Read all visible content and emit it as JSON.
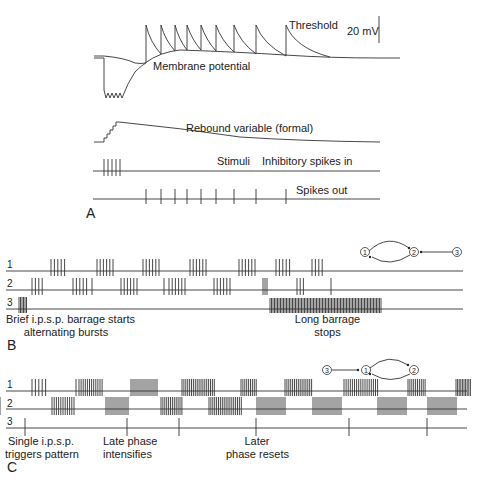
{
  "panel_a": {
    "letter": "A",
    "threshold_label": "Threshold",
    "scale_label": "20 mV",
    "membrane_label": "Membrane potential",
    "rebound_label": "Rebound variable (formal)",
    "stimuli_label": "Stimuli",
    "inhibitory_label": "Inhibitory spikes in",
    "spikes_out_label": "Spikes out",
    "stimuli_x": [
      107,
      111,
      115,
      119,
      123
    ],
    "spikes_out_x": [
      146,
      161,
      175,
      187,
      201,
      216,
      234,
      256,
      286
    ]
  },
  "panel_b": {
    "letter": "B",
    "trace_labels": [
      "1",
      "2",
      "3"
    ],
    "annotation_left_line1": "Brief i.p.s.p. barrage starts",
    "annotation_left_line2": "alternating bursts",
    "annotation_right_line1": "Long barrage",
    "annotation_right_line2": "stops",
    "network": {
      "nodes": [
        "1",
        "2",
        "3"
      ],
      "description": "1 and 2 mutually inhibit; 3 inhibits 2"
    }
  },
  "panel_c": {
    "letter": "C",
    "trace_labels": [
      "1",
      "2",
      "3"
    ],
    "annotation1_line1": "Single i.p.s.p.",
    "annotation1_line2": "triggers pattern",
    "annotation2_line1": "Late phase",
    "annotation2_line2": "intensifies",
    "annotation3_line1": "Later",
    "annotation3_line2": "phase resets",
    "network": {
      "nodes": [
        "3",
        "1",
        "2"
      ],
      "description": "3 inhibits 1; 1 and 2 mutually inhibit"
    },
    "trace3_spikes_x": [
      25,
      127,
      179,
      256,
      349,
      427
    ]
  }
}
